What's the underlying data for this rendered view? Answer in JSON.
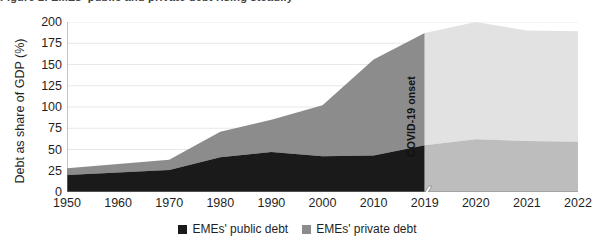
{
  "figure": {
    "clipped_title": "Figure 2. EMEs' public and private debt rising steadily",
    "covid_annotation": "COVID-19 onset"
  },
  "legend": {
    "position": "bottom-center",
    "items": [
      {
        "label": "EMEs' public debt",
        "color": "#1a1a1a"
      },
      {
        "label": "EMEs' private debt",
        "color": "#8c8c8c"
      }
    ]
  },
  "colors": {
    "public_debt": "#1a1a1a",
    "private_debt": "#8c8c8c",
    "public_debt_projection": "#bdbdbd",
    "private_debt_projection": "#e2e2e2",
    "gridline": "#e8e8e8",
    "axis": "#8a8a8a",
    "text": "#1f1f1f"
  },
  "chart_data": {
    "type": "area",
    "title": "",
    "subtitle": "",
    "xlabel": "",
    "ylabel": "Debt as share of GDP (%)",
    "ylim": [
      0,
      200
    ],
    "yticks": [
      0,
      25,
      50,
      75,
      100,
      125,
      150,
      175,
      200
    ],
    "ytick_labels": [
      "0",
      "25",
      "50",
      "75",
      "100",
      "125",
      "150",
      "175",
      "200"
    ],
    "xticks": [
      1950,
      1960,
      1970,
      1980,
      1990,
      2000,
      2010,
      2019,
      2020,
      2021,
      2022
    ],
    "xtick_labels": [
      "1950",
      "1960",
      "1970",
      "1980",
      "1990",
      "2000",
      "2010",
      "2019",
      "2020",
      "2021",
      "2022"
    ],
    "axis_break_after": 2019,
    "grid": "horizontal",
    "stacked": true,
    "x": [
      1950,
      1960,
      1970,
      1980,
      1990,
      2000,
      2010,
      2019,
      2020,
      2021,
      2022
    ],
    "series": [
      {
        "name": "EMEs' public debt",
        "values": [
          20,
          23,
          26,
          41,
          47,
          42,
          43,
          55,
          62,
          60,
          59
        ]
      },
      {
        "name": "EMEs' private debt",
        "values": [
          8,
          10,
          12,
          30,
          38,
          60,
          113,
          132,
          138,
          130,
          130
        ]
      }
    ],
    "totals": [
      28,
      33,
      38,
      71,
      85,
      102,
      156,
      187,
      200,
      190,
      189
    ],
    "annotations": [
      {
        "text": "COVID-19 onset",
        "x": 2019,
        "orientation": "vertical"
      }
    ]
  }
}
